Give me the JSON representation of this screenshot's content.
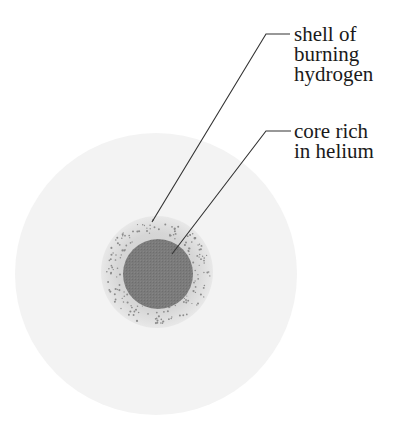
{
  "diagram": {
    "labels": {
      "shell": {
        "lines": [
          "shell of",
          "burning",
          "hydrogen"
        ]
      },
      "core": {
        "lines": [
          "core rich",
          "in helium"
        ]
      }
    },
    "colors": {
      "background": "#ffffff",
      "envelope": "#f2f2f2",
      "shell": "#dcdcdc",
      "shell_dots": "#8a8a8a",
      "core": "#7a7a7a",
      "leader_line": "#333333",
      "text": "#1a1a1a"
    }
  }
}
